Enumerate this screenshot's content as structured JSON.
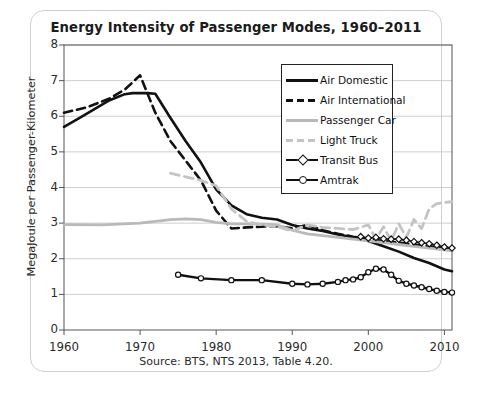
{
  "chart_data": {
    "type": "line",
    "title": "Energy Intensity of Passenger Modes, 1960–2011",
    "xlabel": "",
    "ylabel": "MegaJoule per Passenger-Kilometer",
    "source": "Source: BTS, NTS 2013, Table 4.20.",
    "xlim": [
      1960,
      2011
    ],
    "ylim": [
      0,
      8
    ],
    "xticks": [
      1960,
      1970,
      1980,
      1990,
      2000,
      2010
    ],
    "yticks": [
      0,
      1,
      2,
      3,
      4,
      5,
      6,
      7,
      8
    ],
    "grid": "horizontal",
    "legend_position": "upper-right-inside",
    "series": [
      {
        "name": "Air Domestic",
        "style": "solid",
        "color": "#111111",
        "width": 2.6,
        "marker": "none",
        "x": [
          1960,
          1962,
          1964,
          1966,
          1968,
          1969,
          1970,
          1971,
          1972,
          1974,
          1976,
          1978,
          1980,
          1982,
          1984,
          1986,
          1988,
          1990,
          1992,
          1994,
          1996,
          1998,
          2000,
          2002,
          2004,
          2006,
          2008,
          2010,
          2011
        ],
        "y": [
          5.7,
          5.95,
          6.2,
          6.45,
          6.62,
          6.65,
          6.65,
          6.65,
          6.63,
          5.95,
          5.3,
          4.7,
          3.95,
          3.5,
          3.25,
          3.15,
          3.1,
          2.95,
          2.85,
          2.78,
          2.68,
          2.6,
          2.5,
          2.35,
          2.2,
          2.02,
          1.88,
          1.7,
          1.65
        ]
      },
      {
        "name": "Air International",
        "style": "dashed",
        "color": "#111111",
        "width": 2.6,
        "marker": "none",
        "x": [
          1960,
          1963,
          1966,
          1968,
          1970,
          1972,
          1974,
          1976,
          1978,
          1980,
          1982,
          1984,
          1986,
          1988,
          1990,
          1992,
          1994,
          1996,
          1998,
          2000,
          2002,
          2004,
          2006,
          2008,
          2010,
          2011
        ],
        "y": [
          6.1,
          6.25,
          6.5,
          6.75,
          7.15,
          6.1,
          5.3,
          4.75,
          4.2,
          3.35,
          2.85,
          2.88,
          2.9,
          2.92,
          2.85,
          2.95,
          2.8,
          2.7,
          2.62,
          2.55,
          2.5,
          2.45,
          2.4,
          2.35,
          2.3,
          2.28
        ]
      },
      {
        "name": "Passenger Car",
        "style": "solid",
        "color": "#b9b9b9",
        "width": 2.8,
        "marker": "none",
        "x": [
          1960,
          1965,
          1970,
          1974,
          1976,
          1978,
          1980,
          1982,
          1984,
          1986,
          1988,
          1990,
          1992,
          1994,
          1996,
          1998,
          2000,
          2002,
          2004,
          2006,
          2008,
          2010,
          2011
        ],
        "y": [
          2.96,
          2.95,
          3.0,
          3.1,
          3.12,
          3.1,
          3.02,
          2.98,
          2.98,
          2.97,
          2.95,
          2.8,
          2.7,
          2.65,
          2.6,
          2.55,
          2.5,
          2.45,
          2.4,
          2.35,
          2.3,
          2.25,
          2.22
        ]
      },
      {
        "name": "Light Truck",
        "style": "dashed",
        "color": "#c4c4c4",
        "width": 2.8,
        "marker": "none",
        "x": [
          1974,
          1976,
          1978,
          1980,
          1982,
          1984,
          1986,
          1988,
          1990,
          1992,
          1994,
          1996,
          1998,
          2000,
          2001,
          2002,
          2003,
          2004,
          2005,
          2006,
          2007,
          2008,
          2009,
          2010,
          2011
        ],
        "y": [
          4.4,
          4.3,
          4.2,
          4.05,
          3.4,
          3.05,
          2.95,
          2.9,
          2.78,
          2.95,
          2.88,
          2.85,
          2.82,
          2.95,
          2.55,
          2.9,
          2.5,
          2.98,
          2.6,
          3.1,
          2.85,
          3.4,
          3.55,
          3.58,
          3.6
        ]
      },
      {
        "name": "Transit Bus",
        "style": "solid",
        "color": "#111111",
        "width": 1.6,
        "marker": "diamond",
        "x": [
          1999,
          2000,
          2001,
          2002,
          2003,
          2004,
          2005,
          2006,
          2007,
          2008,
          2009,
          2010,
          2011
        ],
        "y": [
          2.62,
          2.58,
          2.6,
          2.56,
          2.55,
          2.55,
          2.52,
          2.48,
          2.45,
          2.42,
          2.38,
          2.33,
          2.3
        ]
      },
      {
        "name": "Amtrak",
        "style": "solid",
        "color": "#111111",
        "width": 2.4,
        "marker": "circle",
        "x": [
          1975,
          1978,
          1982,
          1986,
          1990,
          1992,
          1994,
          1996,
          1997,
          1998,
          1999,
          2000,
          2001,
          2002,
          2003,
          2004,
          2005,
          2006,
          2007,
          2008,
          2009,
          2010,
          2011
        ],
        "y": [
          1.55,
          1.45,
          1.4,
          1.4,
          1.3,
          1.28,
          1.3,
          1.35,
          1.4,
          1.42,
          1.48,
          1.62,
          1.72,
          1.7,
          1.55,
          1.38,
          1.3,
          1.25,
          1.2,
          1.15,
          1.1,
          1.07,
          1.05
        ]
      }
    ]
  }
}
